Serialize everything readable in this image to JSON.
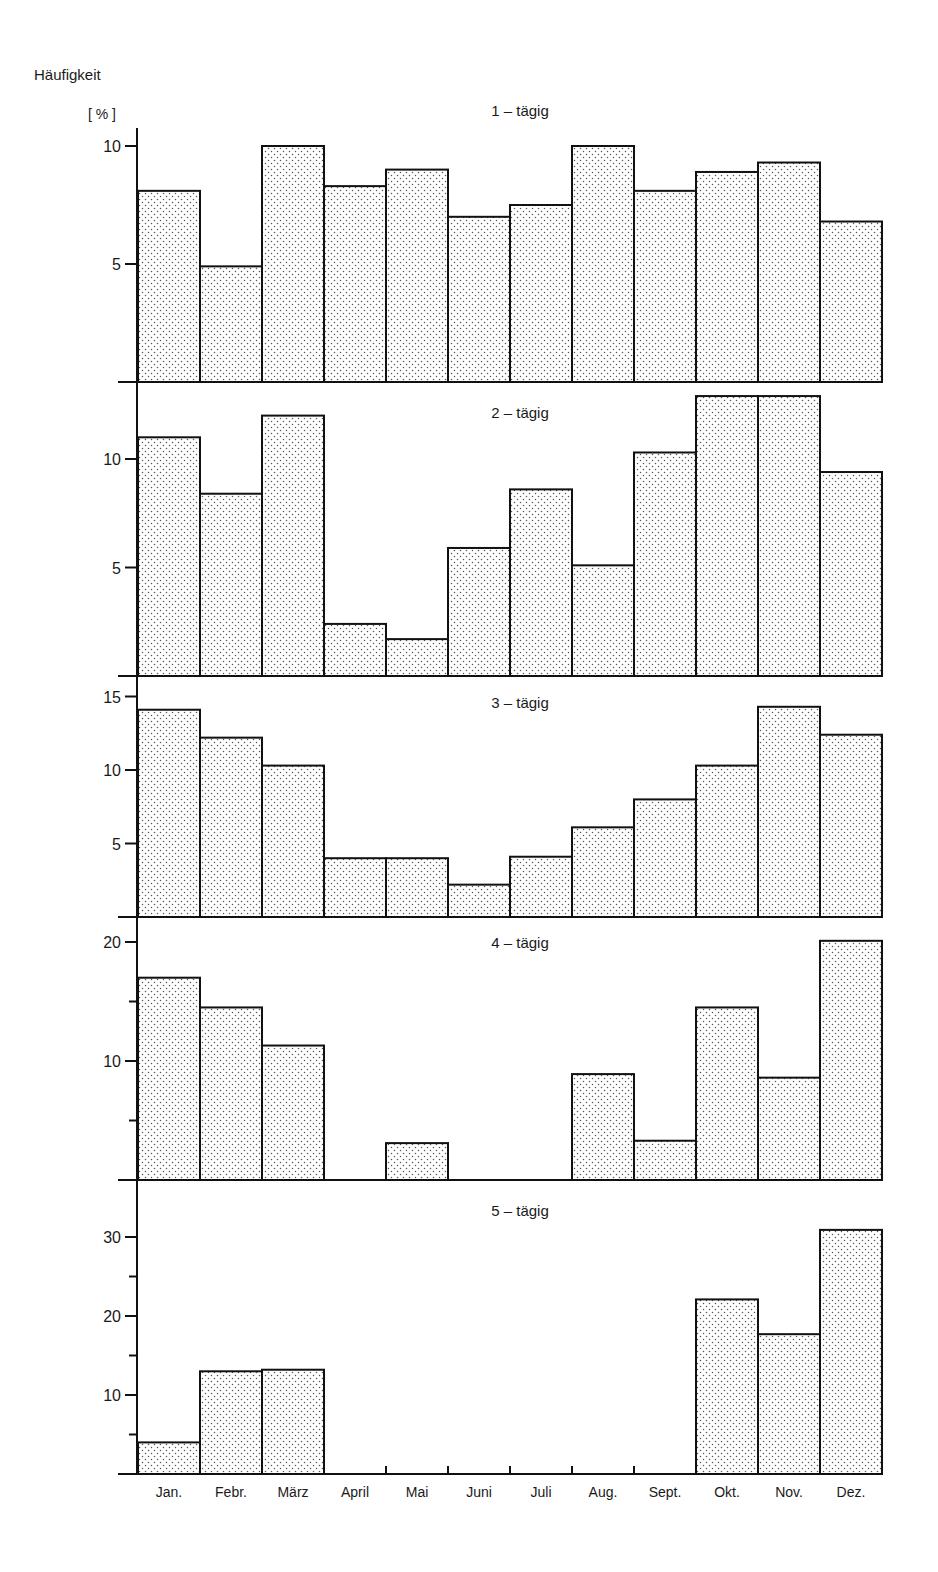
{
  "chart_data": {
    "type": "bar",
    "title": "",
    "ylabel": "Häufigkeit",
    "yunit": "[ % ]",
    "xlabel": "",
    "categories": [
      "Jan.",
      "Febr.",
      "März",
      "April",
      "Mai",
      "Juni",
      "Juli",
      "Aug.",
      "Sept.",
      "Okt.",
      "Nov.",
      "Dez."
    ],
    "grid": false,
    "fill_pattern": "stippled dots",
    "panels": [
      {
        "name": "1 - tägig",
        "values": [
          8.1,
          4.9,
          10.0,
          8.3,
          9.0,
          7.0,
          7.5,
          10.0,
          8.1,
          8.9,
          9.3,
          6.8
        ],
        "ylim": [
          0,
          10
        ],
        "major_ticks": [
          5,
          10
        ],
        "minor_ticks": []
      },
      {
        "name": "2 - tägig",
        "values": [
          11.0,
          8.4,
          12.0,
          2.4,
          1.7,
          5.9,
          8.6,
          5.1,
          10.3,
          12.9,
          12.9,
          9.4
        ],
        "ylim": [
          0,
          13.5
        ],
        "major_ticks": [
          5,
          10
        ],
        "minor_ticks": []
      },
      {
        "name": "3 - tägig",
        "values": [
          14.1,
          12.2,
          10.3,
          4.0,
          4.0,
          2.2,
          4.1,
          6.1,
          8.0,
          10.3,
          14.3,
          12.4
        ],
        "ylim": [
          0,
          16.3
        ],
        "major_ticks": [
          5,
          10,
          15
        ],
        "minor_ticks": []
      },
      {
        "name": "4 - tägig",
        "values": [
          17.0,
          14.5,
          11.3,
          0,
          3.1,
          0,
          0,
          8.9,
          3.3,
          14.5,
          8.6,
          20.1
        ],
        "ylim": [
          0,
          22.5
        ],
        "major_ticks": [
          10,
          20
        ],
        "minor_ticks": [
          5,
          15
        ]
      },
      {
        "name": "5 - tägig",
        "values": [
          4.0,
          13.0,
          13.2,
          0,
          0,
          0,
          0,
          0,
          0,
          22.1,
          17.7,
          30.9
        ],
        "ylim": [
          0,
          37
        ],
        "major_ticks": [
          10,
          20,
          30
        ],
        "minor_ticks": [
          5,
          15,
          25
        ]
      }
    ]
  },
  "layout_panels": [
    {
      "top": 128,
      "base": 382,
      "px_per_unit": 23.6,
      "title_y": 116
    },
    {
      "top": 382,
      "base": 676,
      "px_per_unit": 21.7,
      "title_y": 418
    },
    {
      "top": 676,
      "base": 917,
      "px_per_unit": 14.7,
      "title_y": 708
    },
    {
      "top": 917,
      "base": 1180,
      "px_per_unit": 11.9,
      "title_y": 948
    },
    {
      "top": 1180,
      "base": 1474,
      "px_per_unit": 7.9,
      "title_y": 1216
    }
  ],
  "axis": {
    "y_axis_label": "Häufigkeit",
    "unit_label": "[ % ]"
  }
}
